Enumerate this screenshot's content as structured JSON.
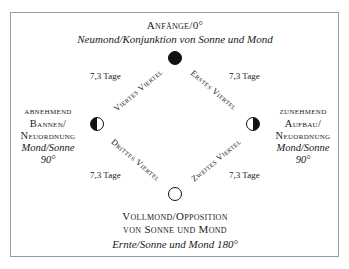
{
  "top": {
    "title": "Anfänge/0°",
    "subtitle": "Neumond/Konjunktion von Sonne und Mond"
  },
  "left": {
    "line1": "abnehmend",
    "line2": "Bannen/",
    "line3": "Neuordnung",
    "line4": "Mond/Sonne",
    "line5": "90°"
  },
  "right": {
    "line1": "zunehmend",
    "line2": "Aufbau/",
    "line3": "Neuordnung",
    "line4": "Mond/Sonne",
    "line5": "90°"
  },
  "bottom": {
    "line1": "Vollmond/Opposition",
    "line2": "von Sonne und Mond",
    "line3": "Ernte/Sonne und Mond 180°"
  },
  "quarters": {
    "first": "Erstes Viertel",
    "second": "Zweites Viertel",
    "third": "Drittes Viertel",
    "fourth": "Viertes Viertel"
  },
  "durations": {
    "top_left": "7,3 Tage",
    "top_right": "7,3 Tage",
    "bottom_left": "7,3 Tage",
    "bottom_right": "7,3 Tage"
  },
  "moons": {
    "new": "new-moon",
    "waxing": "first-quarter-moon",
    "full": "full-moon",
    "waning": "last-quarter-moon"
  }
}
